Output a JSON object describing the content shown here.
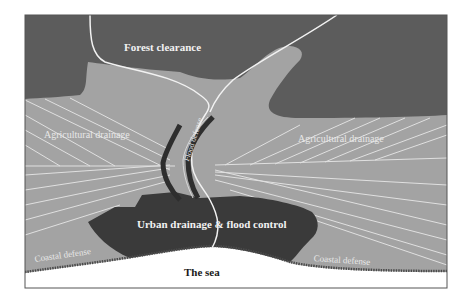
{
  "diagram": {
    "colors": {
      "background": "#ffffff",
      "frame": "#555555",
      "forest": "#5c5c5c",
      "agricultural": "#a3a3a3",
      "urban": "#3a3a3a",
      "sea": "#ffffff",
      "drainage_lines": "#e6e6e6",
      "river": "#f2f2f2",
      "levee": "#2e2e2e",
      "coastal_defense": "#4a4a4a"
    },
    "labels": {
      "forest": "Forest clearance",
      "agri_left": "Agricultural drainage",
      "agri_right": "Agricultural drainage",
      "flood_defense": "Flood defense",
      "urban": "Urban drainage & flood control",
      "coastal_left": "Coastal defense",
      "coastal_right": "Coastal defense",
      "sea": "The sea"
    },
    "zones": [
      {
        "name": "forest",
        "label": "Forest clearance"
      },
      {
        "name": "agricultural-left",
        "label": "Agricultural drainage"
      },
      {
        "name": "agricultural-right",
        "label": "Agricultural drainage"
      },
      {
        "name": "river-levees",
        "label": "Flood defense"
      },
      {
        "name": "urban",
        "label": "Urban drainage & flood control"
      },
      {
        "name": "coast-left",
        "label": "Coastal defense"
      },
      {
        "name": "coast-right",
        "label": "Coastal defense"
      },
      {
        "name": "sea",
        "label": "The sea"
      }
    ]
  }
}
